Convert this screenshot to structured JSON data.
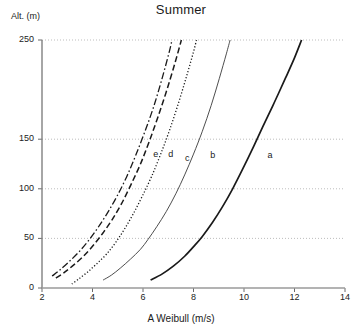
{
  "chart_data": {
    "type": "line",
    "title": "Summer",
    "xlabel": "A Weibull (m/s)",
    "ylabel": "Alt. (m)",
    "xlim": [
      2,
      14
    ],
    "ylim": [
      0,
      250
    ],
    "xticks": [
      2,
      4,
      6,
      8,
      10,
      12,
      14
    ],
    "xtick_labels": [
      "2",
      "4",
      "6",
      "8",
      "10",
      "12",
      "14"
    ],
    "yticks": [
      0,
      50,
      100,
      150,
      250
    ],
    "ytick_labels": [
      "0",
      "50",
      "100",
      "150",
      "250"
    ],
    "gridlines_y": [
      50,
      100,
      150,
      250
    ],
    "grid": "horizontal dotted",
    "legend": "inline curve labels a-e",
    "series": [
      {
        "name": "a",
        "label": "a",
        "style": "solid-thick",
        "color": "#1a1a1a",
        "label_x": 11.05,
        "label_y": 133,
        "points": [
          {
            "x": 6.3,
            "y": 8
          },
          {
            "x": 6.75,
            "y": 14
          },
          {
            "x": 7.2,
            "y": 22
          },
          {
            "x": 7.65,
            "y": 32
          },
          {
            "x": 8.05,
            "y": 43
          },
          {
            "x": 8.35,
            "y": 52
          },
          {
            "x": 8.75,
            "y": 66
          },
          {
            "x": 9.15,
            "y": 82
          },
          {
            "x": 9.55,
            "y": 100
          },
          {
            "x": 9.95,
            "y": 120
          },
          {
            "x": 10.35,
            "y": 141
          },
          {
            "x": 10.75,
            "y": 163
          },
          {
            "x": 11.2,
            "y": 187
          },
          {
            "x": 11.65,
            "y": 212
          },
          {
            "x": 12.0,
            "y": 232
          },
          {
            "x": 12.28,
            "y": 250
          }
        ]
      },
      {
        "name": "b",
        "label": "b",
        "style": "solid-thin",
        "color": "#3a3a3a",
        "label_x": 8.78,
        "label_y": 133,
        "points": [
          {
            "x": 4.42,
            "y": 8
          },
          {
            "x": 4.75,
            "y": 13
          },
          {
            "x": 5.1,
            "y": 20
          },
          {
            "x": 5.5,
            "y": 29
          },
          {
            "x": 5.9,
            "y": 39
          },
          {
            "x": 6.2,
            "y": 49
          },
          {
            "x": 6.55,
            "y": 62
          },
          {
            "x": 6.92,
            "y": 77
          },
          {
            "x": 7.3,
            "y": 95
          },
          {
            "x": 7.65,
            "y": 114
          },
          {
            "x": 8.0,
            "y": 135
          },
          {
            "x": 8.35,
            "y": 158
          },
          {
            "x": 8.7,
            "y": 184
          },
          {
            "x": 9.02,
            "y": 211
          },
          {
            "x": 9.3,
            "y": 236
          },
          {
            "x": 9.45,
            "y": 250
          }
        ]
      },
      {
        "name": "c",
        "label": "c",
        "style": "dotted",
        "color": "#1a1a1a",
        "label_x": 7.78,
        "label_y": 130,
        "points": [
          {
            "x": 3.18,
            "y": 4
          },
          {
            "x": 3.45,
            "y": 9
          },
          {
            "x": 3.8,
            "y": 16
          },
          {
            "x": 4.15,
            "y": 24
          },
          {
            "x": 4.55,
            "y": 34
          },
          {
            "x": 4.92,
            "y": 46
          },
          {
            "x": 5.28,
            "y": 60
          },
          {
            "x": 5.62,
            "y": 75
          },
          {
            "x": 5.98,
            "y": 93
          },
          {
            "x": 6.35,
            "y": 113
          },
          {
            "x": 6.7,
            "y": 135
          },
          {
            "x": 7.05,
            "y": 159
          },
          {
            "x": 7.4,
            "y": 186
          },
          {
            "x": 7.72,
            "y": 213
          },
          {
            "x": 8.0,
            "y": 238
          },
          {
            "x": 8.12,
            "y": 250
          }
        ]
      },
      {
        "name": "d",
        "label": "d",
        "style": "dashed",
        "color": "#1a1a1a",
        "label_x": 7.12,
        "label_y": 134,
        "points": [
          {
            "x": 2.55,
            "y": 10
          },
          {
            "x": 2.85,
            "y": 15
          },
          {
            "x": 3.2,
            "y": 22
          },
          {
            "x": 3.6,
            "y": 31
          },
          {
            "x": 4.0,
            "y": 42
          },
          {
            "x": 4.4,
            "y": 55
          },
          {
            "x": 4.78,
            "y": 69
          },
          {
            "x": 5.15,
            "y": 85
          },
          {
            "x": 5.52,
            "y": 104
          },
          {
            "x": 5.9,
            "y": 125
          },
          {
            "x": 6.25,
            "y": 148
          },
          {
            "x": 6.6,
            "y": 173
          },
          {
            "x": 6.95,
            "y": 200
          },
          {
            "x": 7.28,
            "y": 228
          },
          {
            "x": 7.52,
            "y": 250
          }
        ]
      },
      {
        "name": "e",
        "label": "e",
        "style": "dash-dot",
        "color": "#1a1a1a",
        "label_x": 6.52,
        "label_y": 134,
        "points": [
          {
            "x": 2.4,
            "y": 12
          },
          {
            "x": 2.7,
            "y": 18
          },
          {
            "x": 3.05,
            "y": 26
          },
          {
            "x": 3.45,
            "y": 36
          },
          {
            "x": 3.85,
            "y": 48
          },
          {
            "x": 4.22,
            "y": 61
          },
          {
            "x": 4.6,
            "y": 76
          },
          {
            "x": 4.98,
            "y": 93
          },
          {
            "x": 5.35,
            "y": 112
          },
          {
            "x": 5.7,
            "y": 133
          },
          {
            "x": 6.05,
            "y": 156
          },
          {
            "x": 6.4,
            "y": 181
          },
          {
            "x": 6.72,
            "y": 208
          },
          {
            "x": 7.02,
            "y": 236
          },
          {
            "x": 7.15,
            "y": 250
          }
        ]
      }
    ]
  }
}
